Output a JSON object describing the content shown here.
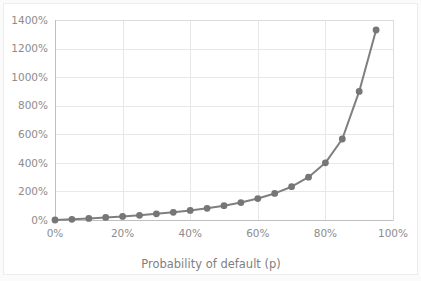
{
  "chart_data": {
    "type": "line",
    "title": "",
    "xlabel": "Probability of default (p)",
    "ylabel": "",
    "xlim": [
      0,
      100
    ],
    "ylim": [
      0,
      1400
    ],
    "grid": true,
    "legend": "none",
    "x_unit": "%",
    "y_unit": "%",
    "xticks": [
      "0%",
      "20%",
      "40%",
      "60%",
      "80%",
      "100%"
    ],
    "xtick_values": [
      0,
      20,
      40,
      60,
      80,
      100
    ],
    "yticks": [
      "0%",
      "200%",
      "400%",
      "600%",
      "800%",
      "1000%",
      "1200%",
      "1400%"
    ],
    "ytick_values": [
      0,
      200,
      400,
      600,
      800,
      1000,
      1200,
      1400
    ],
    "series": [
      {
        "name": "Credit spread",
        "color": "#7f7f7f",
        "marker": "circle",
        "x": [
          0,
          5,
          10,
          15,
          20,
          25,
          30,
          35,
          40,
          45,
          50,
          55,
          60,
          65,
          70,
          75,
          80,
          85,
          90,
          95
        ],
        "values": [
          0,
          5,
          11,
          18,
          25,
          33,
          43,
          54,
          67,
          82,
          100,
          122,
          150,
          186,
          233,
          300,
          400,
          567,
          900,
          1330
        ]
      }
    ]
  },
  "colors": {
    "background": "#fbfbfb",
    "plot_area": "#ffffff",
    "gridline": "#e8e8e8",
    "axis": "#bfbfbf",
    "tick_text": "#8c8c8c",
    "axis_title_text": "#7f7f7f",
    "series": "#7f7f7f"
  }
}
